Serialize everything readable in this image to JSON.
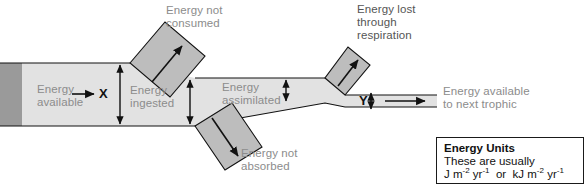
{
  "diagram": {
    "colors": {
      "band_light": "#e2e2e2",
      "band_dark": "#9a9a9a",
      "branch_fill": "#bdbdbd",
      "outline": "#111111",
      "label_gray": "#8c8c8c",
      "label_dark": "#555555",
      "background": "#ffffff"
    },
    "labels": {
      "energy_available": "Energy\navailable",
      "energy_not_consumed": "Energy not\nconsumed",
      "energy_ingested": "Energy\ningested",
      "energy_not_absorbed": "Energy not\nabsorbed",
      "energy_assimilated": "Energy\nassimilated",
      "energy_lost_respiration": "Energy lost\nthrough\nrespiration",
      "energy_next_trophic": "Energy available\nto next trophic"
    },
    "variables": {
      "x_label": "X",
      "y_label": "Y"
    },
    "units_box": {
      "title": "Energy Units",
      "line2": "These are usually",
      "unit_a_base": "J m",
      "unit_a_sup1": "-2",
      "unit_a_mid": " yr",
      "unit_a_sup2": "-1",
      "conjunction": "or",
      "unit_b_base": "kJ m",
      "unit_b_sup1": "-2",
      "unit_b_mid": " yr",
      "unit_b_sup2": "-1"
    }
  }
}
